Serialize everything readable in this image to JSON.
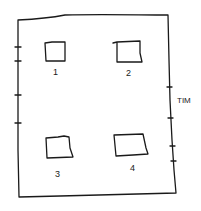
{
  "diagram": {
    "type": "hand-drawn sketch",
    "frame": {
      "description": "rectangular outer frame with tick marks on left and right edges",
      "left_ticks": 4,
      "right_ticks": 4
    },
    "boxes": [
      {
        "id": 1,
        "label": "1"
      },
      {
        "id": 2,
        "label": "2"
      },
      {
        "id": 3,
        "label": "3"
      },
      {
        "id": 4,
        "label": "4"
      }
    ],
    "side_label": "TIM",
    "colors": {
      "ink": "#1a1a1a",
      "background": "#ffffff"
    }
  }
}
